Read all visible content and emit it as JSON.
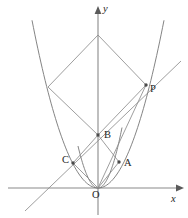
{
  "figure": {
    "width": 188,
    "height": 218,
    "background": "#ffffff",
    "stroke_color": "#8d8d8d",
    "axis_color": "#8a8a8a",
    "label_color": "#262626"
  },
  "axes": {
    "x_label": "x",
    "y_label": "y",
    "x_label_pos": {
      "x": 171,
      "y": 194
    },
    "y_label_pos": {
      "x": 103,
      "y": 4
    },
    "x_axis": {
      "x1": 8,
      "y1": 188,
      "x2": 176,
      "y2": 188
    },
    "y_axis": {
      "x1": 98,
      "y1": 215,
      "x2": 98,
      "y2": 14
    },
    "origin": {
      "x": 98,
      "y": 188
    }
  },
  "points": [
    {
      "name": "P",
      "x": 146,
      "y": 85,
      "label_x": 150,
      "label_y": 84,
      "dot": true
    },
    {
      "name": "B",
      "x": 98,
      "y": 135,
      "label_x": 104,
      "label_y": 130,
      "dot": true
    },
    {
      "name": "C",
      "x": 73,
      "y": 163,
      "label_x": 62,
      "label_y": 155,
      "dot": true
    },
    {
      "name": "A",
      "x": 119,
      "y": 162,
      "label_x": 124,
      "label_y": 158,
      "dot": true
    },
    {
      "name": "O",
      "x": 98,
      "y": 188,
      "label_x": 92,
      "label_y": 190,
      "dot": false
    }
  ],
  "curves": [
    {
      "name": "parabola-outer",
      "type": "quadratic-parabola",
      "vertex": {
        "x": 98,
        "y": 188
      },
      "a": 0.0385,
      "x_from": 32,
      "x_to": 164
    },
    {
      "name": "parabola-inner",
      "type": "quadratic-parabola",
      "vertex": {
        "x": 98,
        "y": 188
      },
      "a": 0.105,
      "x_from": 78,
      "x_to": 122
    }
  ],
  "segments": [
    {
      "name": "apex-to-left-vertex",
      "x1": 98,
      "y1": 35,
      "x2": 48,
      "y2": 87
    },
    {
      "name": "apex-to-right-vertex",
      "x1": 98,
      "y1": 35,
      "x2": 146,
      "y2": 85
    },
    {
      "name": "left-vertex-to-B",
      "x1": 48,
      "y1": 87,
      "x2": 98,
      "y2": 135
    },
    {
      "name": "B-to-P",
      "x1": 98,
      "y1": 135,
      "x2": 146,
      "y2": 85
    },
    {
      "name": "C-to-B",
      "x1": 73,
      "y1": 163,
      "x2": 98,
      "y2": 135
    },
    {
      "name": "B-to-A",
      "x1": 98,
      "y1": 135,
      "x2": 119,
      "y2": 162
    },
    {
      "name": "C-to-O",
      "x1": 73,
      "y1": 163,
      "x2": 98,
      "y2": 188
    },
    {
      "name": "A-to-O",
      "x1": 119,
      "y1": 162,
      "x2": 98,
      "y2": 188
    },
    {
      "name": "O-to-P",
      "x1": 98,
      "y1": 188,
      "x2": 146,
      "y2": 85
    }
  ],
  "rays": [
    {
      "name": "line-through-C-and-P",
      "x1": 25,
      "y1": 211,
      "x2": 181,
      "y2": 61
    }
  ],
  "caption": ""
}
